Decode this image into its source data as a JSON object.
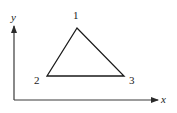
{
  "diagram": {
    "type": "triangle-element",
    "axes": {
      "x_label": "x",
      "y_label": "y",
      "color": "#3a3a3a"
    },
    "triangle": {
      "stroke_color": "#1a1a1a",
      "vertices": [
        {
          "id": "1",
          "label": "1",
          "x": 77,
          "y": 28
        },
        {
          "id": "2",
          "label": "2",
          "x": 47,
          "y": 76
        },
        {
          "id": "3",
          "label": "3",
          "x": 124,
          "y": 76
        }
      ]
    }
  }
}
